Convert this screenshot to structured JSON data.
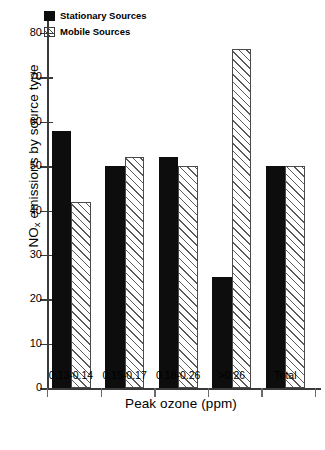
{
  "chart_data": {
    "type": "bar",
    "title": "",
    "xlabel": "Peak ozone (ppm)",
    "ylabel": "NOx emissions by source type",
    "ylabel_prefix": "NO",
    "ylabel_subscript": "x",
    "ylabel_suffix": " emissions by source type",
    "categories": [
      "0.13-0.14",
      "0.15-0.17",
      "0.18-0.26",
      ">0.26",
      "Total"
    ],
    "series": [
      {
        "name": "Stationary Sources",
        "values": [
          58,
          50,
          52,
          25,
          50
        ]
      },
      {
        "name": "Mobile Sources",
        "values": [
          42,
          52,
          50,
          76.5,
          50
        ]
      }
    ],
    "ylim": [
      0,
      80
    ],
    "ytick_values": [
      0,
      10,
      20,
      30,
      40,
      50,
      60,
      70,
      80
    ],
    "ytick_labels": [
      "0",
      "10",
      "20",
      "30",
      "40",
      "50",
      "60",
      "70",
      "80"
    ],
    "grid": false,
    "legend_position": "top-left",
    "colors": {
      "stationary_fill": "#0d0d0d",
      "mobile_fill": "#ffffff",
      "mobile_hatch": "#5a5a5a",
      "axis": "#3a3a3a",
      "text": "#000000",
      "background": "#ffffff"
    }
  },
  "legend": {
    "items": [
      {
        "label": "Stationary Sources",
        "style": "solid-black"
      },
      {
        "label": "Mobile Sources",
        "style": "diagonal-hatch"
      }
    ]
  }
}
